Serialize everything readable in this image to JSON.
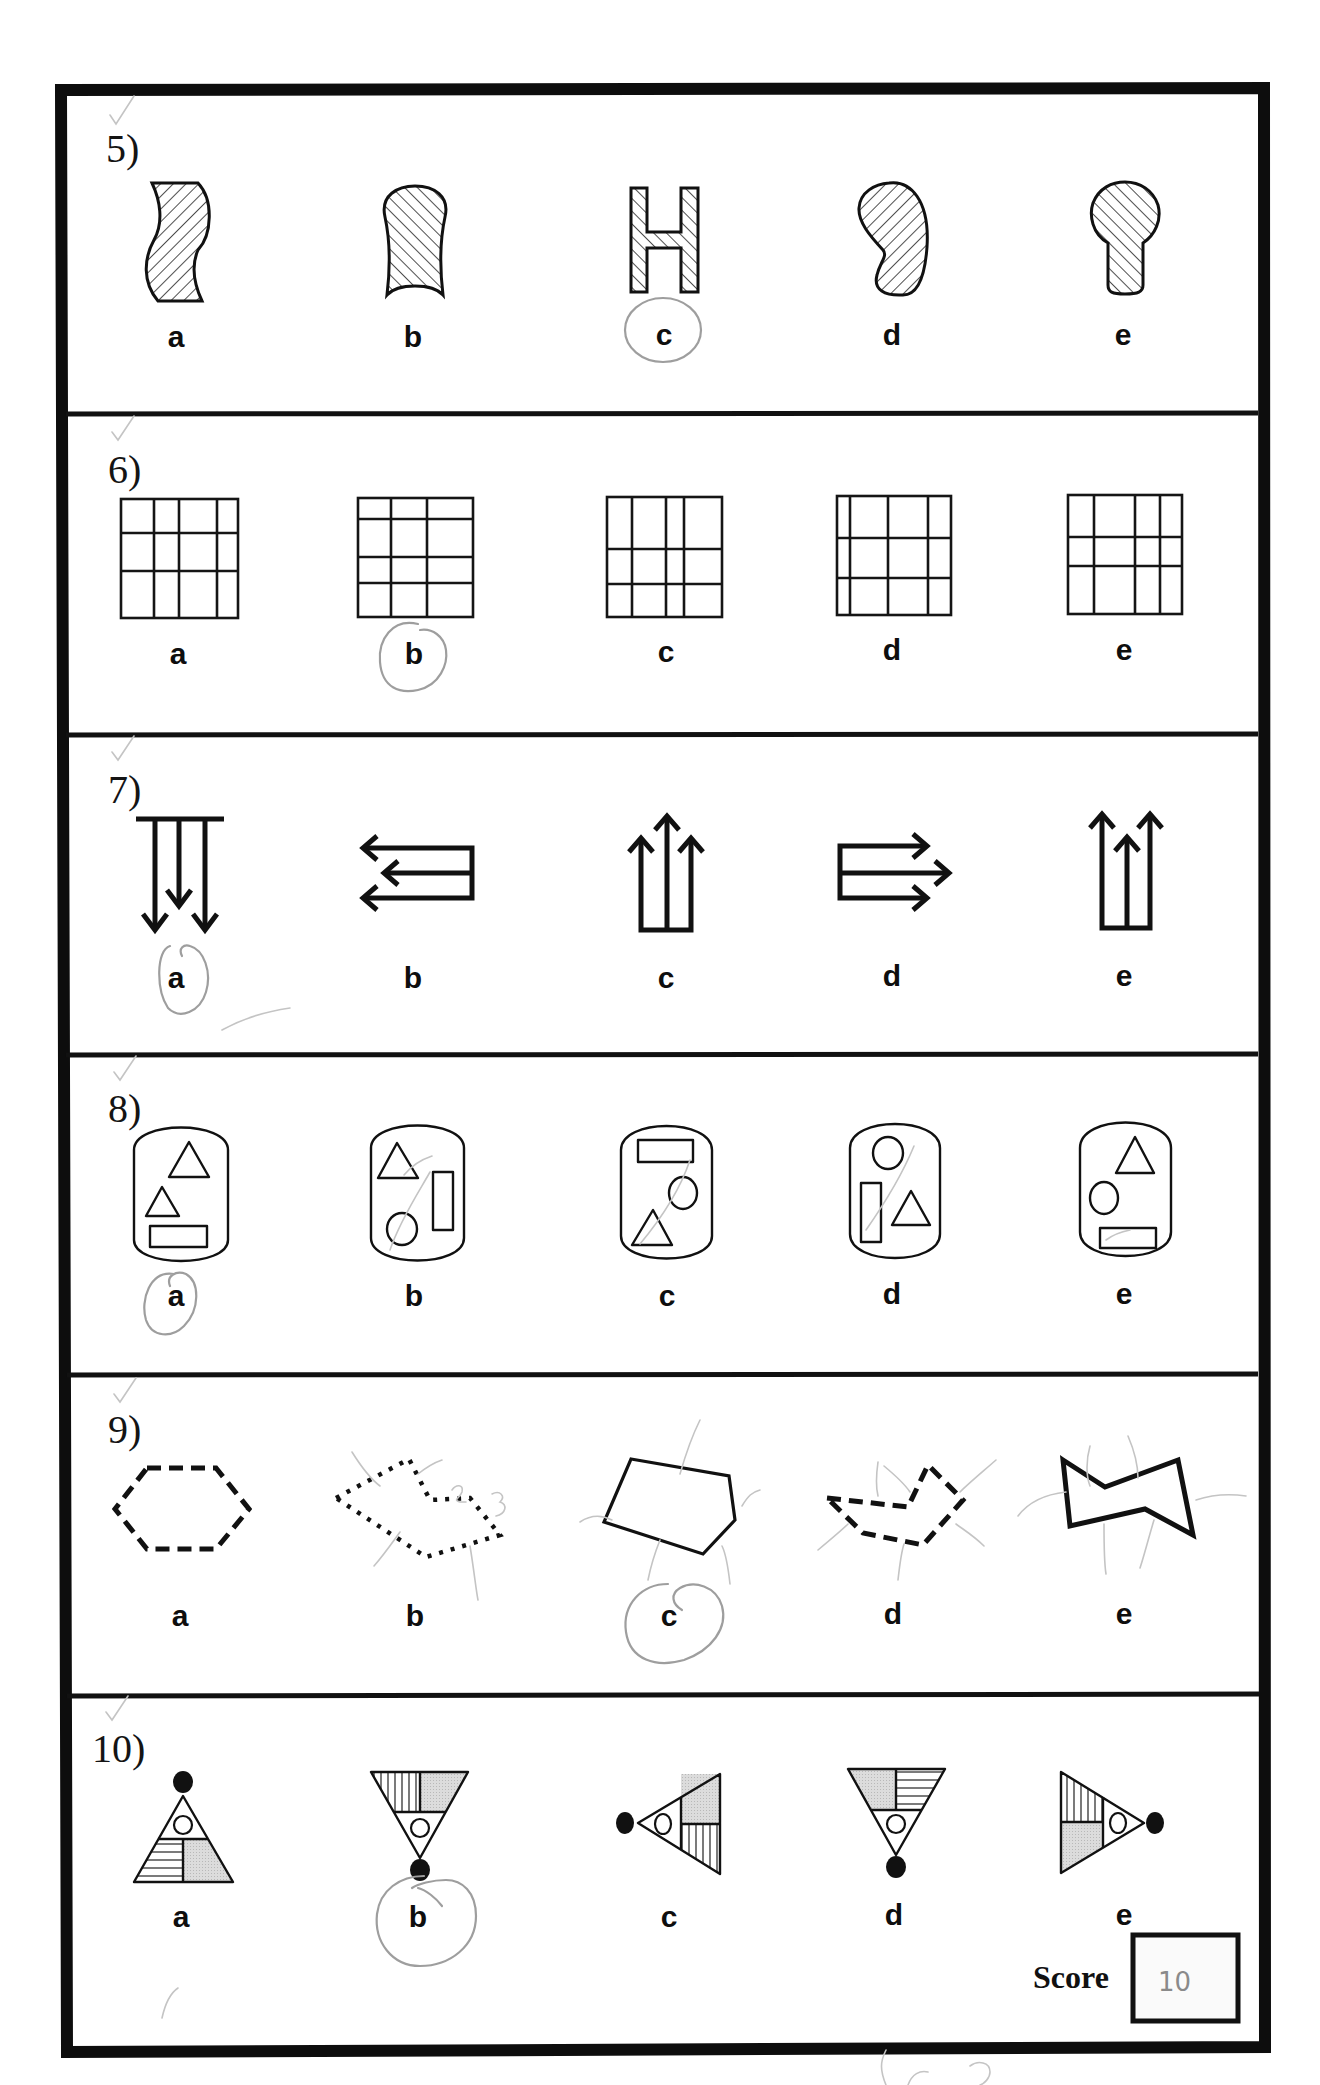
{
  "worksheet": {
    "outer_frame": {
      "stroke": "#0d0d0d"
    },
    "questions": [
      {
        "number": "5)",
        "options": [
          "a",
          "b",
          "c",
          "d",
          "e"
        ],
        "selected": "c",
        "shapes": [
          "wavy-band",
          "dome-with-concave-base",
          "letter-H",
          "bean",
          "keyhole"
        ],
        "hatch": [
          "diagonal-back",
          "diagonal-forward",
          "diagonal-forward",
          "diagonal-back",
          "diagonal-forward"
        ]
      },
      {
        "number": "6)",
        "options": [
          "a",
          "b",
          "c",
          "d",
          "e"
        ],
        "selected": "b",
        "shapes": [
          "grid-4col-3row",
          "grid-3col-4row",
          "grid-4col-3row",
          "grid-4col-3row",
          "grid-4col-3row"
        ]
      },
      {
        "number": "7)",
        "options": [
          "a",
          "b",
          "c",
          "d",
          "e"
        ],
        "selected": "a",
        "shapes": [
          "three-arrows-down",
          "three-arrows-left",
          "three-arrows-up-middle-tall",
          "three-arrows-right",
          "three-arrows-up-middle-short"
        ]
      },
      {
        "number": "8)",
        "options": [
          "a",
          "b",
          "c",
          "d",
          "e"
        ],
        "selected": "a",
        "shapes": [
          "capsule-two-triangles-rectangle",
          "capsule-triangle-rectangle-circle",
          "capsule-rectangle-circle-triangle",
          "capsule-circle-rectangle-triangle",
          "capsule-triangle-circle-rectangle"
        ]
      },
      {
        "number": "9)",
        "options": [
          "a",
          "b",
          "c",
          "d",
          "e"
        ],
        "selected": "c",
        "shapes": [
          "dashed-hexagon",
          "dotted-concave-hexagon",
          "solid-pentagon",
          "dashed-concave-hexagon",
          "solid-bowtie-hexagon"
        ],
        "pencil_annotations": [
          "1",
          "2",
          "3"
        ]
      },
      {
        "number": "10)",
        "options": [
          "a",
          "b",
          "c",
          "d",
          "e"
        ],
        "selected": "b",
        "shapes": [
          "triangle-up-dot-top",
          "triangle-down-dot-bottom",
          "triangle-left-dot-left",
          "triangle-down-dot-bottom-mirrored",
          "triangle-right-dot-right"
        ]
      }
    ],
    "score": {
      "label": "Score",
      "value": "10"
    },
    "colors": {
      "ink": "#111111",
      "pencil": "#9e9e9e",
      "shade": "#d6d6d6",
      "paper": "#ffffff"
    }
  }
}
